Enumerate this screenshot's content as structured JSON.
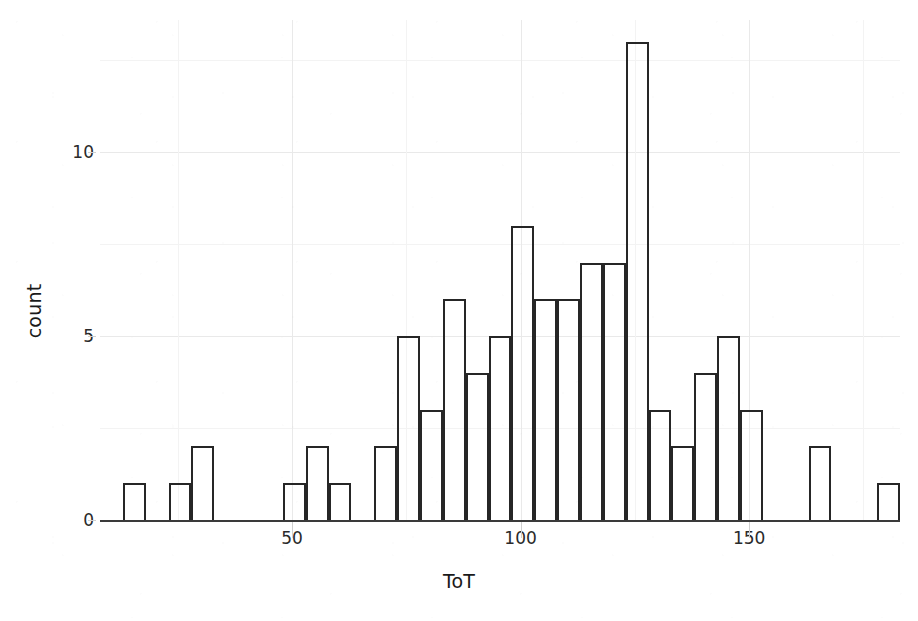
{
  "chart_data": {
    "type": "bar",
    "subtype": "histogram",
    "title": "",
    "subtitle": "",
    "xlabel": "ToT",
    "ylabel": "count",
    "xlim": [
      8,
      183
    ],
    "ylim": [
      0,
      13.6
    ],
    "grid": true,
    "legend": null,
    "legend_position": "none",
    "bin_width": 5,
    "x_tick_labels": [
      "50",
      "100",
      "150"
    ],
    "x_tick_values": [
      50,
      100,
      150
    ],
    "y_tick_labels": [
      "0",
      "5",
      "10"
    ],
    "y_tick_values": [
      0,
      5,
      10
    ],
    "bin_starts": [
      13,
      18,
      23,
      28,
      33,
      38,
      43,
      48,
      53,
      58,
      63,
      68,
      73,
      78,
      83,
      88,
      93,
      98,
      103,
      108,
      113,
      118,
      123,
      128,
      133,
      138,
      143,
      148,
      153,
      158,
      163,
      168,
      173,
      178
    ],
    "categories": [
      "13-18",
      "18-23",
      "23-28",
      "28-33",
      "33-38",
      "38-43",
      "43-48",
      "48-53",
      "53-58",
      "58-63",
      "63-68",
      "68-73",
      "73-78",
      "78-83",
      "83-88",
      "88-93",
      "93-98",
      "98-103",
      "103-108",
      "108-113",
      "113-118",
      "118-123",
      "123-128",
      "128-133",
      "133-138",
      "138-143",
      "143-148",
      "148-153",
      "153-158",
      "158-163",
      "163-168",
      "168-173",
      "173-178",
      "178-183"
    ],
    "values": [
      1,
      0,
      1,
      2,
      0,
      0,
      0,
      1,
      2,
      1,
      0,
      2,
      5,
      3,
      6,
      4,
      5,
      8,
      6,
      6,
      7,
      7,
      13,
      3,
      2,
      4,
      5,
      3,
      0,
      0,
      2,
      0,
      0,
      1
    ],
    "bar_style": {
      "fill": "transparent",
      "stroke": "#262626",
      "stroke_width": 2
    },
    "colors": {
      "background": "#ffffff",
      "axis_text": "#2a2a2a",
      "axis_title": "#1a1a1a",
      "gridline_major": "#e9e9e9",
      "gridline_minor": "#f3f3f3",
      "axis_line": "#3a3a3a",
      "bar_outline": "#262626"
    }
  },
  "axes": {
    "y_title": "count",
    "x_title": "ToT"
  }
}
